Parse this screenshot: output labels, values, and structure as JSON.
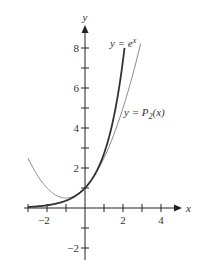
{
  "chart_data": {
    "type": "line",
    "title": "",
    "xlabel": "x",
    "ylabel": "y",
    "xlim": [
      -3.2,
      4.9
    ],
    "ylim": [
      -2.6,
      9.1
    ],
    "grid": false,
    "x_ticks": [
      -3,
      -2,
      -1,
      1,
      2,
      3,
      4
    ],
    "x_tick_labels": {
      "-2": "−2",
      "2": "2",
      "4": "4"
    },
    "y_ticks": [
      -2,
      -1,
      1,
      2,
      3,
      4,
      5,
      6,
      7,
      8
    ],
    "y_tick_labels": {
      "-2": "−2",
      "2": "2",
      "4": "4",
      "6": "6",
      "8": "8"
    },
    "series": [
      {
        "name": "y = e^x",
        "function": "exp(x)",
        "x_range": [
          -3,
          2.08
        ],
        "style": "dark-thick",
        "color": "#333333",
        "label_main": "y = e",
        "label_sup": "x",
        "sample_points": [
          [
            -3,
            0.05
          ],
          [
            -2,
            0.14
          ],
          [
            -1,
            0.37
          ],
          [
            0,
            1
          ],
          [
            1,
            2.72
          ],
          [
            2,
            7.39
          ],
          [
            2.08,
            8.0
          ]
        ]
      },
      {
        "name": "y = P2(x)",
        "function": "1 + x + x^2/2",
        "x_range": [
          -3,
          2.93
        ],
        "style": "gray-thin",
        "color": "#888888",
        "label_main": "y = P",
        "label_sub": "2",
        "label_tail": "(x)",
        "sample_points": [
          [
            -3,
            2.5
          ],
          [
            -2,
            1
          ],
          [
            -1,
            0.5
          ],
          [
            0,
            1
          ],
          [
            1,
            2.5
          ],
          [
            2,
            5
          ],
          [
            2.93,
            8.22
          ]
        ]
      }
    ]
  }
}
